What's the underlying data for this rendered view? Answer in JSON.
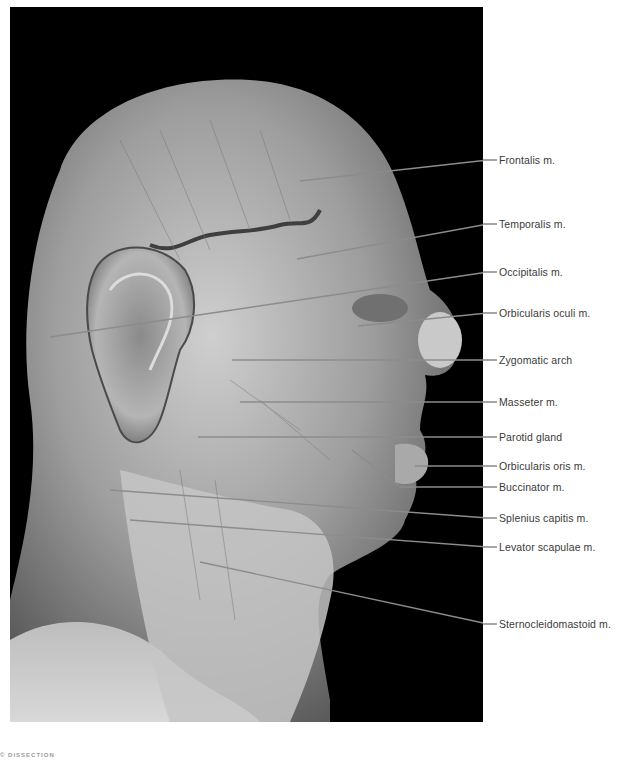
{
  "figure": {
    "photo": {
      "x": 10,
      "y": 7,
      "width": 473,
      "height": 715,
      "background": "#000000"
    },
    "leader_color": "#8c8c8c",
    "label_color": "#3a3a3a",
    "caption": "© DISSECTION"
  },
  "labels": [
    {
      "id": "frontalis",
      "text": "Frontalis m.",
      "label_y": 160,
      "line": [
        [
          300,
          181
        ],
        [
          488,
          160
        ]
      ]
    },
    {
      "id": "temporalis",
      "text": "Temporalis m.",
      "label_y": 224,
      "line": [
        [
          297,
          259
        ],
        [
          488,
          224
        ]
      ]
    },
    {
      "id": "occipitalis",
      "text": "Occipitalis m.",
      "label_y": 272,
      "line": [
        [
          50,
          337
        ],
        [
          488,
          272
        ]
      ]
    },
    {
      "id": "orbicularis-oculi",
      "text": "Orbicularis oculi m.",
      "label_y": 313,
      "line": [
        [
          358,
          326
        ],
        [
          488,
          313
        ]
      ]
    },
    {
      "id": "zygomatic-arch",
      "text": "Zygomatic arch",
      "label_y": 360,
      "line": [
        [
          232,
          360
        ],
        [
          488,
          360
        ]
      ]
    },
    {
      "id": "masseter",
      "text": "Masseter m.",
      "label_y": 402,
      "line": [
        [
          240,
          402
        ],
        [
          488,
          402
        ]
      ]
    },
    {
      "id": "parotid-gland",
      "text": "Parotid gland",
      "label_y": 437,
      "line": [
        [
          198,
          437
        ],
        [
          488,
          437
        ]
      ]
    },
    {
      "id": "orbicularis-oris",
      "text": "Orbicularis oris m.",
      "label_y": 466,
      "line": [
        [
          415,
          466
        ],
        [
          488,
          466
        ]
      ]
    },
    {
      "id": "buccinator",
      "text": "Buccinator m.",
      "label_y": 487,
      "line": [
        [
          352,
          450
        ],
        [
          400,
          487
        ],
        [
          488,
          487
        ]
      ]
    },
    {
      "id": "splenius-capitis",
      "text": "Splenius capitis m.",
      "label_y": 518,
      "line": [
        [
          110,
          490
        ],
        [
          488,
          518
        ]
      ]
    },
    {
      "id": "levator-scapulae",
      "text": "Levator scapulae m.",
      "label_y": 547,
      "line": [
        [
          130,
          520
        ],
        [
          488,
          547
        ]
      ]
    },
    {
      "id": "sternocleidomastoid",
      "text": "Sternocleidomastoid m.",
      "label_y": 624,
      "line": [
        [
          200,
          562
        ],
        [
          488,
          624
        ]
      ]
    }
  ]
}
